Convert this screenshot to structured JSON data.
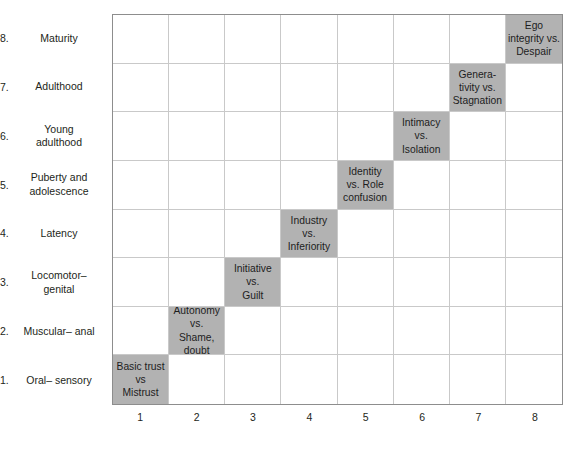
{
  "figure": {
    "grid": {
      "rows": 8,
      "columns": 8
    },
    "colors": {
      "cell_fill": "#b2b2b2",
      "grid_line": "#c9c9c9",
      "grid_border": "#8d8d8d",
      "text": "#231f20",
      "background": "#ffffff"
    }
  },
  "row_labels": [
    {
      "num": "8.",
      "text": "Maturity"
    },
    {
      "num": "7.",
      "text": "Adulthood"
    },
    {
      "num": "6.",
      "text": "Young adulthood"
    },
    {
      "num": "5.",
      "text": "Puberty and adolescence"
    },
    {
      "num": "4.",
      "text": "Latency"
    },
    {
      "num": "3.",
      "text": "Locomotor– genital"
    },
    {
      "num": "2.",
      "text": "Muscular– anal"
    },
    {
      "num": "1.",
      "text": "Oral– sensory"
    }
  ],
  "column_labels": [
    "1",
    "2",
    "3",
    "4",
    "5",
    "6",
    "7",
    "8"
  ],
  "cells": [
    {
      "row": 8,
      "col": 8,
      "line1": "Ego",
      "line2": "integrity vs.",
      "line3": "Despair"
    },
    {
      "row": 7,
      "col": 7,
      "line1": "Genera-",
      "line2": "tivity vs.",
      "line3": "Stagnation"
    },
    {
      "row": 6,
      "col": 6,
      "line1": "Intimacy",
      "line2": "vs.",
      "line3": "Isolation"
    },
    {
      "row": 5,
      "col": 5,
      "line1": "Identity",
      "line2": "vs. Role",
      "line3": "confusion"
    },
    {
      "row": 4,
      "col": 4,
      "line1": "Industry",
      "line2": "vs.",
      "line3": "Inferiority"
    },
    {
      "row": 3,
      "col": 3,
      "line1": "Initiative",
      "line2": "vs.",
      "line3": "Guilt"
    },
    {
      "row": 2,
      "col": 2,
      "line1": "Autonomy",
      "line2": "vs. Shame,",
      "line3": "doubt"
    },
    {
      "row": 1,
      "col": 1,
      "line1": "Basic trust",
      "line2": "vs",
      "line3": "Mistrust"
    }
  ]
}
